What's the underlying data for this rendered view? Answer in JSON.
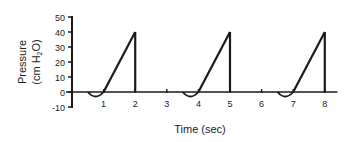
{
  "chart_data": {
    "type": "line",
    "title": "",
    "xlabel": "Time (sec)",
    "ylabel_line1": "Pressure",
    "ylabel_line2_prefix": "(cm H",
    "ylabel_line2_sub": "2",
    "ylabel_line2_suffix": "O)",
    "xlim": [
      0,
      8.4
    ],
    "ylim": [
      -10,
      50
    ],
    "x_ticks": [
      1,
      2,
      3,
      4,
      5,
      6,
      7,
      8
    ],
    "x_tick_labels": [
      "1",
      "2",
      "3",
      "4",
      "5",
      "6",
      "7",
      "8"
    ],
    "y_ticks": [
      50,
      40,
      30,
      20,
      10,
      0,
      -10
    ],
    "y_tick_labels": [
      "50",
      "40",
      "30",
      "20",
      "10",
      "0",
      "-10"
    ],
    "grid": false,
    "legend": null,
    "series": [
      {
        "name": "Airway pressure",
        "color": "#1a1a1a",
        "points": [
          [
            0,
            0
          ],
          [
            0.5,
            0
          ],
          [
            0.7,
            -2.5
          ],
          [
            0.9,
            -1.5
          ],
          [
            1.0,
            0
          ],
          [
            2.0,
            40
          ],
          [
            2.0,
            0
          ],
          [
            3.5,
            0
          ],
          [
            3.7,
            -2.5
          ],
          [
            3.9,
            -1.5
          ],
          [
            4.0,
            0
          ],
          [
            5.0,
            40
          ],
          [
            5.0,
            0
          ],
          [
            6.5,
            0
          ],
          [
            6.7,
            -2.5
          ],
          [
            6.9,
            -1.5
          ],
          [
            7.0,
            0
          ],
          [
            8.0,
            40
          ],
          [
            8.0,
            0
          ],
          [
            8.4,
            0
          ]
        ]
      }
    ],
    "cycles": [
      {
        "negative_dip_start": 0.5,
        "inspiration_start": 1.0,
        "peak_time": 2.0,
        "peak_pressure": 40
      },
      {
        "negative_dip_start": 3.5,
        "inspiration_start": 4.0,
        "peak_time": 5.0,
        "peak_pressure": 40
      },
      {
        "negative_dip_start": 6.5,
        "inspiration_start": 7.0,
        "peak_time": 8.0,
        "peak_pressure": 40
      }
    ]
  }
}
